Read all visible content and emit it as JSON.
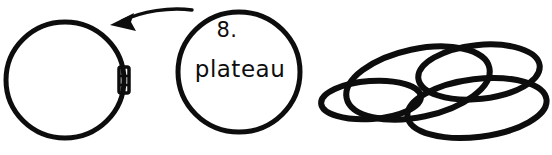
{
  "canvas": {
    "width": 552,
    "height": 155,
    "background": "#ffffff",
    "ink_color": "#0d0d0d",
    "style": "hand-drawn-sketch"
  },
  "diagram": {
    "node_label_number": "8.",
    "node_label_word": "plateau"
  },
  "shapes": {
    "left_circle": {
      "name": "empty-circle",
      "cx": 65,
      "cy": 80,
      "rx": 59,
      "ry": 58,
      "stroke_width": 5
    },
    "hinge": {
      "name": "clasp-hinge",
      "x": 119,
      "y": 67,
      "width": 10,
      "height": 26
    },
    "arrow": {
      "name": "curved-arrow",
      "direction": "left",
      "tail_x": 192,
      "tail_y": 10,
      "head_x": 113,
      "head_y": 22
    },
    "labeled_circle": {
      "name": "labeled-circle",
      "cx": 239,
      "cy": 72,
      "rx": 61,
      "ry": 60,
      "stroke_width": 5
    },
    "cluster": {
      "name": "overlapping-ellipse-cluster",
      "count": 4,
      "ellipses": [
        {
          "name": "ellipse-front-left",
          "cx": 371,
          "cy": 100,
          "rx": 50,
          "ry": 19,
          "rotate": -4,
          "stroke_width": 6
        },
        {
          "name": "ellipse-center-large",
          "cx": 418,
          "cy": 83,
          "rx": 73,
          "ry": 34,
          "rotate": -12,
          "stroke_width": 6
        },
        {
          "name": "ellipse-top-right",
          "cx": 479,
          "cy": 72,
          "rx": 61,
          "ry": 27,
          "rotate": -6,
          "stroke_width": 6
        },
        {
          "name": "ellipse-bottom-right",
          "cx": 477,
          "cy": 108,
          "rx": 70,
          "ry": 29,
          "rotate": -7,
          "stroke_width": 6
        }
      ]
    }
  }
}
